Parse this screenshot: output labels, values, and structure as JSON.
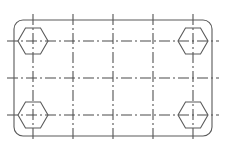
{
  "drawing": {
    "title": "Rectangular mounting plate with four hexagonal corner bolts",
    "type": "engineering-line-drawing",
    "canvas": {
      "width": 228,
      "height": 153
    },
    "background_color": "#ffffff",
    "outline_color": "#5a5a5a",
    "centerline_color": "#4a4a4a",
    "plate": {
      "label": "plate-outline",
      "x": 14,
      "y": 20,
      "width": 198,
      "height": 116,
      "corner_radius": 9,
      "stroke_width": 1.1
    },
    "hexagons": {
      "label": "hex-bolt-head",
      "count": 4,
      "radius": 15,
      "orientation": "pointy-left-right",
      "stroke_width": 1.1,
      "centers": [
        {
          "name": "top-left",
          "cx": 33,
          "cy": 41
        },
        {
          "name": "top-right",
          "cx": 193,
          "cy": 41
        },
        {
          "name": "bottom-left",
          "cx": 33,
          "cy": 115
        },
        {
          "name": "bottom-right",
          "cx": 193,
          "cy": 115
        }
      ]
    },
    "centerlines": {
      "label": "dash-dot-centerline",
      "dash_pattern": "11 3 2 3",
      "stroke_width": 1.05,
      "vertical": {
        "count": 5,
        "x_positions": [
          33,
          73,
          113,
          153,
          193
        ],
        "y_start": 14,
        "y_end": 142
      },
      "horizontal": {
        "count": 3,
        "y_positions": [
          41,
          78,
          115
        ],
        "x_start": 7,
        "x_end": 219
      }
    }
  }
}
